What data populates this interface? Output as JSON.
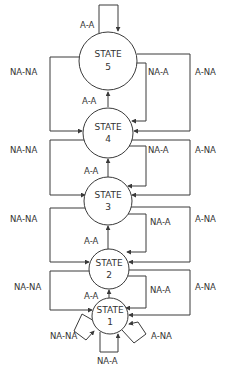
{
  "diagram": {
    "type": "state-transition",
    "states": [
      {
        "id": 5,
        "title": "STATE",
        "number": "5"
      },
      {
        "id": 4,
        "title": "STATE",
        "number": "4"
      },
      {
        "id": 3,
        "title": "STATE",
        "number": "3"
      },
      {
        "id": 2,
        "title": "STATE",
        "number": "2"
      },
      {
        "id": 1,
        "title": "STATE",
        "number": "1"
      }
    ],
    "labels": {
      "aa": "A-A",
      "nana": "NA-NA",
      "naa": "NA-A",
      "ana": "A-NA"
    },
    "transitions": [
      {
        "from": 5,
        "to": 5,
        "label": "A-A"
      },
      {
        "from": 5,
        "to": 4,
        "label": "NA-NA"
      },
      {
        "from": 5,
        "to": 4,
        "label": "NA-A"
      },
      {
        "from": 5,
        "to": 4,
        "label": "A-NA"
      },
      {
        "from": 4,
        "to": 5,
        "label": "A-A"
      },
      {
        "from": 4,
        "to": 3,
        "label": "NA-NA"
      },
      {
        "from": 4,
        "to": 3,
        "label": "NA-A"
      },
      {
        "from": 4,
        "to": 3,
        "label": "A-NA"
      },
      {
        "from": 3,
        "to": 4,
        "label": "A-A"
      },
      {
        "from": 3,
        "to": 2,
        "label": "NA-NA"
      },
      {
        "from": 3,
        "to": 2,
        "label": "NA-A"
      },
      {
        "from": 3,
        "to": 2,
        "label": "A-NA"
      },
      {
        "from": 2,
        "to": 3,
        "label": "A-A"
      },
      {
        "from": 2,
        "to": 1,
        "label": "NA-NA"
      },
      {
        "from": 2,
        "to": 1,
        "label": "NA-A"
      },
      {
        "from": 2,
        "to": 1,
        "label": "A-NA"
      },
      {
        "from": 1,
        "to": 2,
        "label": "A-A"
      },
      {
        "from": 1,
        "to": 1,
        "label": "NA-NA"
      },
      {
        "from": 1,
        "to": 1,
        "label": "NA-A"
      },
      {
        "from": 1,
        "to": 1,
        "label": "A-NA"
      }
    ]
  }
}
